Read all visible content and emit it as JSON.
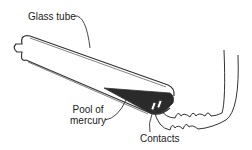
{
  "diagram": {
    "type": "mercury switch",
    "labels": {
      "glass_tube": "Glass tube",
      "pool_line1": "Pool of",
      "pool_line2": "mercury",
      "contacts": "Contacts"
    },
    "colors": {
      "stroke": "#333333",
      "mercury": "#2a2a2a",
      "background": "#ffffff"
    }
  }
}
